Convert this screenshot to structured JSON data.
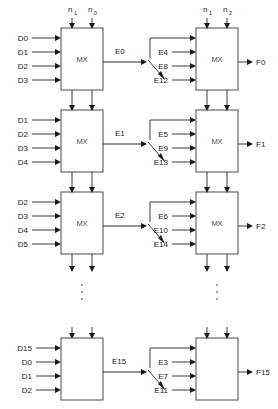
{
  "diagram": {
    "block_label": "MX",
    "control_labels": {
      "left_top": "n",
      "left_top_sub_a": "1",
      "left_top_sub_b": "0",
      "right_top": "n",
      "right_top_sub_a": "1",
      "right_top_sub_b": "2"
    },
    "ellipsis": "⋮",
    "colors": {
      "wire": "#3a3a3a",
      "box_stroke": "#4a4a4a",
      "arrow": "#1a1a1a",
      "text": "#1a1a1a",
      "mx_text": "#4a4a4a",
      "dots": "#8a8a8a",
      "background": "#ffffff"
    },
    "rows": [
      {
        "id": "row-0",
        "left_inputs": [
          "D0",
          "D1",
          "D2",
          "D3"
        ],
        "intermediate": "E0",
        "right_inputs": [
          "E4",
          "E8",
          "E12"
        ],
        "output": "F0",
        "left_block": "MX",
        "right_block": "MX"
      },
      {
        "id": "row-1",
        "left_inputs": [
          "D1",
          "D2",
          "D3",
          "D4"
        ],
        "intermediate": "E1",
        "right_inputs": [
          "E5",
          "E9",
          "E13"
        ],
        "output": "F1",
        "left_block": "MX",
        "right_block": "MX"
      },
      {
        "id": "row-2",
        "left_inputs": [
          "D2",
          "D3",
          "D4",
          "D5"
        ],
        "intermediate": "E2",
        "right_inputs": [
          "E6",
          "E10",
          "E14"
        ],
        "output": "F2",
        "left_block": "MX",
        "right_block": "MX"
      },
      {
        "id": "row-last",
        "left_inputs": [
          "D15",
          "D0",
          "D1",
          "D2"
        ],
        "intermediate": "E15",
        "right_inputs": [
          "E3",
          "E7",
          "E11"
        ],
        "output": "F15",
        "left_block": "",
        "right_block": ""
      }
    ]
  }
}
